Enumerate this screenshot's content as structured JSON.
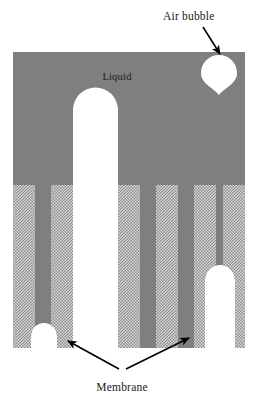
{
  "figure": {
    "title_alt": "Cross-section of a liquid-filled membrane structure with an air bubble",
    "background_color": "#ffffff",
    "labels": {
      "air_bubble": "Air bubble",
      "liquid": "Liquid",
      "membrane": "Membrane"
    },
    "colors": {
      "solid_gray": "#7f7f7f",
      "hatch_light": "#d8d8d8",
      "hatch_dark": "#8a8a8a",
      "white": "#ffffff",
      "text": "#1a1a1a",
      "arrow": "#000000"
    },
    "geometry": {
      "block_left": 13,
      "block_right": 245,
      "block_top": 52,
      "block_bottom": 348,
      "liquid_region_bottom": 185,
      "center_arch_left": 73,
      "center_arch_right": 118,
      "center_arch_top": 88,
      "bubble_cx": 219,
      "bubble_cy": 76,
      "bubble_r": 19
    },
    "annotations": [
      {
        "name": "air-bubble-arrow",
        "from_x": 205,
        "from_y": 28,
        "to_x": 221,
        "to_y": 56
      },
      {
        "name": "membrane-arrow-left",
        "from_x": 118,
        "from_y": 373,
        "to_x": 67,
        "to_y": 341
      },
      {
        "name": "membrane-arrow-right",
        "from_x": 126,
        "from_y": 373,
        "to_x": 190,
        "to_y": 338
      }
    ],
    "membrane_columns_left": [
      {
        "x": 13,
        "width": 22,
        "fill": "hatch"
      },
      {
        "x": 35,
        "width": 16,
        "fill": "solid"
      },
      {
        "x": 51,
        "width": 22,
        "fill": "hatch"
      }
    ],
    "membrane_columns_right": [
      {
        "x": 118,
        "width": 22,
        "fill": "hatch"
      },
      {
        "x": 140,
        "width": 16,
        "fill": "solid"
      },
      {
        "x": 156,
        "width": 22,
        "fill": "hatch"
      },
      {
        "x": 178,
        "width": 16,
        "fill": "solid"
      },
      {
        "x": 194,
        "width": 22,
        "fill": "hatch"
      },
      {
        "x": 216,
        "width": 7,
        "fill": "solid"
      },
      {
        "x": 223,
        "width": 22,
        "fill": "hatch"
      }
    ],
    "bottom_cavities": [
      {
        "name": "bottom-left-cavity",
        "cx": 44,
        "top": 323,
        "half_width": 13
      },
      {
        "name": "bottom-right-cavity",
        "cx": 220,
        "top": 265,
        "half_width": 15
      }
    ]
  }
}
